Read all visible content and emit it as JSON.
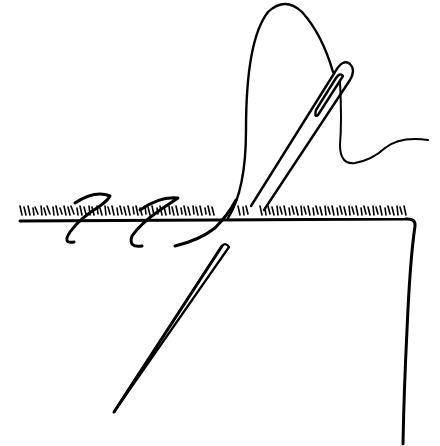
{
  "illustration": {
    "subject": "needle and thread sewing a hem stitch on fabric",
    "colors": {
      "background": "#ffffff",
      "ink": "#000000"
    },
    "elements": [
      "fabric-edge",
      "fabric-fringe",
      "upper-needle",
      "lower-needle-tip",
      "thread-loop",
      "thread-tail",
      "stitch-loops"
    ]
  }
}
